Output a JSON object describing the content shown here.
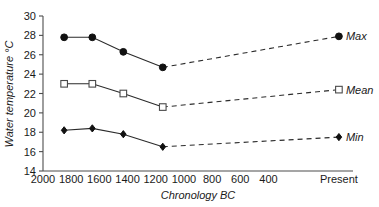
{
  "chart_data": {
    "type": "line",
    "title": "",
    "xlabel": "Chronology BC",
    "ylabel": "Water temperature °C",
    "xlim": [
      2000,
      -200
    ],
    "ylim": [
      14,
      30
    ],
    "ytick_step": 2,
    "grid": false,
    "legend_position": "right-inline",
    "x_tick_labels": [
      "2000",
      "1800",
      "1600",
      "1400",
      "1200",
      "1000",
      "800",
      "600",
      "400",
      "Present"
    ],
    "x_tick_values": [
      2000,
      1800,
      1600,
      1400,
      1200,
      1000,
      800,
      600,
      400,
      -100
    ],
    "y_tick_labels": [
      "30",
      "28",
      "26",
      "24",
      "22",
      "20",
      "18",
      "16",
      "14"
    ],
    "y_tick_values": [
      30,
      28,
      26,
      24,
      22,
      20,
      18,
      16,
      14
    ],
    "x": [
      1850,
      1650,
      1430,
      1150,
      -100
    ],
    "series": [
      {
        "name": "Max",
        "label": "Max",
        "marker": "circle",
        "values": [
          27.8,
          27.8,
          26.3,
          24.7,
          27.9
        ],
        "solid_segment_count": 4,
        "color": "#111111"
      },
      {
        "name": "Mean",
        "label": "Mean",
        "marker": "square",
        "values": [
          23.0,
          23.0,
          22.0,
          20.6,
          22.4
        ],
        "solid_segment_count": 4,
        "color": "#4a4a4a"
      },
      {
        "name": "Min",
        "label": "Min",
        "marker": "diamond",
        "values": [
          18.2,
          18.4,
          17.8,
          16.5,
          17.5
        ],
        "solid_segment_count": 4,
        "color": "#111111"
      }
    ]
  },
  "axes": {
    "x_title": "Chronology BC",
    "y_title": "Water temperature °C"
  },
  "legend": {
    "max_label": "Max",
    "mean_label": "Mean",
    "min_label": "Min"
  }
}
